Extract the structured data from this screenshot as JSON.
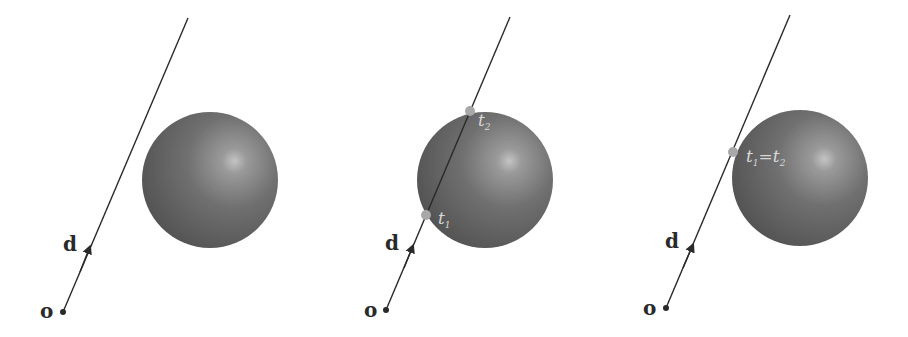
{
  "figure": {
    "colors": {
      "background": "#ffffff",
      "ray": "#2a2a2a",
      "sphere_dark": "#5a5a5a",
      "sphere_light": "#bdbdbd",
      "hit_point": "#a8a8a8",
      "label_on_sphere": "#d8d8d8"
    },
    "panels": [
      {
        "name": "miss",
        "origin_label": "o",
        "direction_label": "d",
        "hits": []
      },
      {
        "name": "two-intersections",
        "origin_label": "o",
        "direction_label": "d",
        "hits": [
          {
            "label": "t",
            "sub": "1"
          },
          {
            "label": "t",
            "sub": "2"
          }
        ]
      },
      {
        "name": "tangent",
        "origin_label": "o",
        "direction_label": "d",
        "hits": [
          {
            "label_a": "t",
            "sub_a": "1",
            "equals": "=",
            "label_b": "t",
            "sub_b": "2"
          }
        ]
      }
    ]
  }
}
